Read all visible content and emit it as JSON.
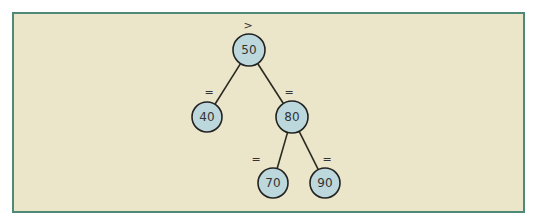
{
  "diagram": {
    "type": "binary-tree",
    "colors": {
      "background": "#ebe6c9",
      "border": "#4f8a78",
      "node_fill": "#bcd8dc",
      "node_stroke": "#222222",
      "edge": "#2b2b20"
    },
    "nodes": [
      {
        "id": "n50",
        "label": "50",
        "mark": ">",
        "x": 249,
        "y": 50,
        "r": 16,
        "mx": 248,
        "my": 29
      },
      {
        "id": "n40",
        "label": "40",
        "mark": "=",
        "x": 207,
        "y": 117,
        "r": 15,
        "mx": 209,
        "my": 96
      },
      {
        "id": "n80",
        "label": "80",
        "mark": "=",
        "x": 292,
        "y": 117,
        "r": 16,
        "mx": 289,
        "my": 96
      },
      {
        "id": "n70",
        "label": "70",
        "mark": "=",
        "x": 273,
        "y": 183,
        "r": 15,
        "mx": 256,
        "my": 163
      },
      {
        "id": "n90",
        "label": "90",
        "mark": "=",
        "x": 325,
        "y": 183,
        "r": 15,
        "mx": 327,
        "my": 163
      }
    ],
    "edges": [
      {
        "from": "n50",
        "to": "n40"
      },
      {
        "from": "n50",
        "to": "n80"
      },
      {
        "from": "n80",
        "to": "n70"
      },
      {
        "from": "n80",
        "to": "n90"
      }
    ]
  }
}
